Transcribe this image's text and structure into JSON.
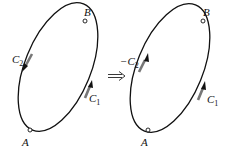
{
  "diagram": {
    "left": {
      "points": {
        "A": "A",
        "B": "B"
      },
      "paths": [
        {
          "label": "C",
          "sub": "2",
          "sign": "",
          "direction": "down",
          "side": "left"
        },
        {
          "label": "C",
          "sub": "1",
          "sign": "",
          "direction": "up",
          "side": "right"
        }
      ]
    },
    "operator": "⇒",
    "right": {
      "points": {
        "A": "A",
        "B": "B"
      },
      "paths": [
        {
          "label": "C",
          "sub": "2",
          "sign": "−",
          "direction": "up",
          "side": "left"
        },
        {
          "label": "C",
          "sub": "1",
          "sign": "",
          "direction": "up",
          "side": "right"
        }
      ]
    }
  }
}
